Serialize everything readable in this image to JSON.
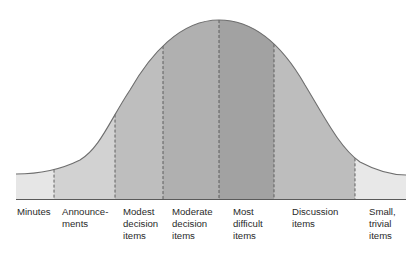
{
  "diagram": {
    "type": "bell-curve",
    "colors": {
      "curve_stroke": "#6e6e6e",
      "divider": "#555555",
      "baseline": "#5a5a5a"
    },
    "segments": [
      {
        "id": "minutes",
        "label": "Minutes",
        "x0": 16,
        "x1": 54,
        "fill": "#e6e6e6",
        "label_x": 17
      },
      {
        "id": "announcements",
        "label": "Announce-\nments",
        "x0": 54,
        "x1": 115,
        "fill": "#d2d2d2",
        "label_x": 62
      },
      {
        "id": "modest-decision-items",
        "label": "Modest\ndecision\nitems",
        "x0": 115,
        "x1": 163,
        "fill": "#bebebe",
        "label_x": 123
      },
      {
        "id": "moderate-decision-items",
        "label": "Moderate\ndecision\nitems",
        "x0": 163,
        "x1": 219,
        "fill": "#b0b0b0",
        "label_x": 172
      },
      {
        "id": "most-difficult-items",
        "label": "Most\ndifficult\nitems",
        "x0": 219,
        "x1": 274,
        "fill": "#a2a2a2",
        "label_x": 233
      },
      {
        "id": "discussion-items",
        "label": "Discussion\nitems",
        "x0": 274,
        "x1": 355,
        "fill": "#bdbdbd",
        "label_x": 292
      },
      {
        "id": "small-trivial-items",
        "label": "Small,\ntrivial\nitems",
        "x0": 355,
        "x1": 406,
        "fill": "#e8e8e8",
        "label_x": 369
      }
    ]
  }
}
